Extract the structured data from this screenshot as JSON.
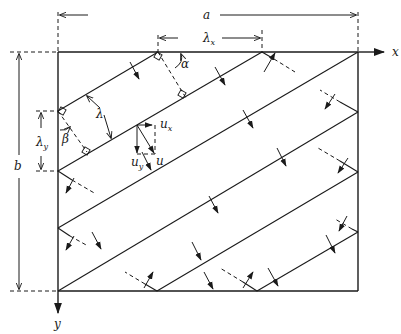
{
  "figure": {
    "type": "geometric diagram",
    "labels": {
      "a": "a",
      "b": "b",
      "lambda_x": "λ",
      "lambda_x_sub": "x",
      "lambda_y": "λ",
      "lambda_y_sub": "y",
      "lambda": "λ",
      "alpha": "α",
      "beta": "β",
      "x_axis": "x",
      "y_axis": "y",
      "u": "u",
      "u_x": "u",
      "u_x_sub": "x",
      "u_y": "u",
      "u_y_sub": "y"
    },
    "colors": {
      "ink": "#1a1a1a",
      "background": "#ffffff"
    }
  }
}
